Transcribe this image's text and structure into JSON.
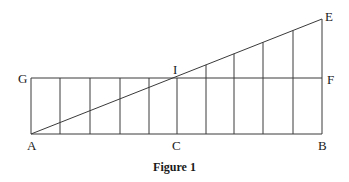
{
  "figure": {
    "caption": "Figure 1",
    "stroke_color": "#3a3a3a",
    "points": {
      "A": {
        "label": "A",
        "x": 31,
        "y": 134
      },
      "B": {
        "label": "B",
        "x": 322,
        "y": 134
      },
      "C": {
        "label": "C",
        "x": 177,
        "y": 134
      },
      "E": {
        "label": "E",
        "x": 322,
        "y": 19
      },
      "F": {
        "label": "F",
        "x": 322,
        "y": 78
      },
      "G": {
        "label": "G",
        "x": 31,
        "y": 78
      },
      "I": {
        "label": "I",
        "x": 177,
        "y": 78
      }
    },
    "segments": [
      {
        "name": "AB",
        "from": "A",
        "to": "B"
      },
      {
        "name": "GF",
        "from": "G",
        "to": "F"
      },
      {
        "name": "AE",
        "from": "A",
        "to": "E"
      },
      {
        "name": "GA",
        "from": "G",
        "to": "A"
      },
      {
        "name": "IC",
        "from": "I",
        "to": "C"
      },
      {
        "name": "EB",
        "from": "E",
        "to": "B"
      }
    ],
    "left_verticals_x": [
      60,
      90,
      120,
      149
    ],
    "left_verticals_top_y": 78,
    "right_verticals_x": [
      206,
      234,
      263,
      293
    ],
    "baseline_y": 134
  }
}
